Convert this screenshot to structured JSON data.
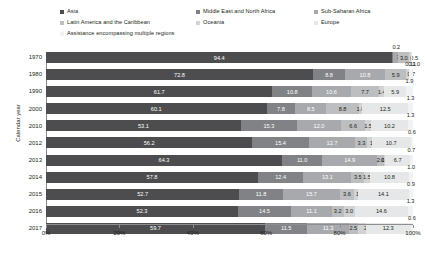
{
  "chart_data": {
    "type": "bar",
    "orientation": "horizontal",
    "stacked": true,
    "stacked_mode": "percent",
    "title": "",
    "xlabel": "",
    "ylabel": "Calendar year",
    "xlim": [
      0,
      100
    ],
    "xticks": [
      0,
      20,
      40,
      60,
      80,
      100
    ],
    "xticklabels": [
      "0%",
      "20%",
      "40%",
      "60%",
      "80%",
      "100%"
    ],
    "grid": false,
    "legend_position": "top",
    "categories": [
      "1970",
      "1980",
      "1990",
      "2000",
      "2010",
      "2012",
      "2013",
      "2014",
      "2015",
      "2016",
      "2017"
    ],
    "series": [
      {
        "name": "Asia",
        "color": "#4d4d4f",
        "values": [
          94.4,
          72.8,
          61.7,
          60.1,
          53.1,
          56.2,
          64.3,
          57.8,
          52.7,
          52.3,
          59.7
        ]
      },
      {
        "name": "Middle East and North Africa",
        "color": "#808285",
        "values": [
          0.2,
          8.8,
          10.8,
          7.8,
          15.3,
          15.4,
          11.0,
          12.4,
          11.8,
          14.5,
          11.5
        ]
      },
      {
        "name": "Sub-Saharan Africa",
        "color": "#a7a9ac",
        "values": [
          1.4,
          10.8,
          10.6,
          8.5,
          12.0,
          12.7,
          14.9,
          13.1,
          15.7,
          11.1,
          11.3
        ]
      },
      {
        "name": "Latin America and the Caribbean",
        "color": "#bcbec0",
        "values": [
          3.0,
          5.9,
          7.7,
          8.8,
          6.6,
          3.3,
          2.0,
          3.5,
          3.6,
          3.2,
          2.5
        ]
      },
      {
        "name": "Oceania",
        "color": "#d1d3d4",
        "values": [
          0.5,
          0.7,
          1.4,
          1.0,
          1.5,
          1.1,
          0.3,
          1.5,
          1.1,
          3.0,
          2.1
        ]
      },
      {
        "name": "Europe",
        "color": "#e6e7e8",
        "values": [
          0.1,
          0.1,
          5.9,
          12.5,
          10.2,
          10.7,
          6.7,
          10.8,
          14.1,
          14.6,
          12.3
        ]
      },
      {
        "name": "Assistance encompassing multiple regions",
        "color": "#f1f2f2",
        "values": [
          0.0,
          1.0,
          1.9,
          1.3,
          1.3,
          0.6,
          0.7,
          1.0,
          0.9,
          1.3,
          0.6
        ]
      }
    ],
    "rows": [
      {
        "year": "1970",
        "segments": [
          {
            "series": "Asia",
            "value": "94.4",
            "pos": "in"
          },
          {
            "series": "Middle East and North Africa",
            "value": "0.2",
            "pos": "out-right"
          },
          {
            "series": "Sub-Saharan Africa",
            "value": "1.4",
            "pos": "side"
          },
          {
            "series": "Latin America and the Caribbean",
            "value": "3.0",
            "pos": "in"
          },
          {
            "series": "Oceania",
            "value": "0.5",
            "pos": "side-below"
          },
          {
            "series": "Europe",
            "value": "0.1",
            "pos": "below"
          },
          {
            "series": "Assistance encompassing multiple regions",
            "value": "",
            "pos": "none"
          }
        ]
      },
      {
        "year": "1980",
        "segments": [
          {
            "series": "Asia",
            "value": "72.8",
            "pos": "in"
          },
          {
            "series": "Middle East and North Africa",
            "value": "8.8",
            "pos": "in"
          },
          {
            "series": "Sub-Saharan Africa",
            "value": "10.8",
            "pos": "in"
          },
          {
            "series": "Latin America and the Caribbean",
            "value": "5.9",
            "pos": "in"
          },
          {
            "series": "Oceania",
            "value": "0.7",
            "pos": "side"
          },
          {
            "series": "Europe",
            "value": "0.1",
            "pos": "above"
          },
          {
            "series": "Assistance encompassing multiple regions",
            "value": "1.0",
            "pos": "out-right"
          }
        ]
      },
      {
        "year": "1990",
        "segments": [
          {
            "series": "Asia",
            "value": "61.7",
            "pos": "in"
          },
          {
            "series": "Middle East and North Africa",
            "value": "10.8",
            "pos": "in"
          },
          {
            "series": "Sub-Saharan Africa",
            "value": "10.6",
            "pos": "in"
          },
          {
            "series": "Latin America and the Caribbean",
            "value": "7.7",
            "pos": "in"
          },
          {
            "series": "Oceania",
            "value": "1.4",
            "pos": "in"
          },
          {
            "series": "Europe",
            "value": "5.9",
            "pos": "in"
          },
          {
            "series": "Assistance encompassing multiple regions",
            "value": "1.9",
            "pos": "above"
          }
        ]
      },
      {
        "year": "2000",
        "segments": [
          {
            "series": "Asia",
            "value": "60.1",
            "pos": "in"
          },
          {
            "series": "Middle East and North Africa",
            "value": "7.8",
            "pos": "in"
          },
          {
            "series": "Sub-Saharan Africa",
            "value": "8.5",
            "pos": "in"
          },
          {
            "series": "Latin America and the Caribbean",
            "value": "8.8",
            "pos": "in"
          },
          {
            "series": "Oceania",
            "value": "1.0",
            "pos": "in"
          },
          {
            "series": "Europe",
            "value": "12.5",
            "pos": "in"
          },
          {
            "series": "Assistance encompassing multiple regions",
            "value": "1.3",
            "pos": "above"
          }
        ]
      },
      {
        "year": "2010",
        "segments": [
          {
            "series": "Asia",
            "value": "53.1",
            "pos": "in"
          },
          {
            "series": "Middle East and North Africa",
            "value": "15.3",
            "pos": "in"
          },
          {
            "series": "Sub-Saharan Africa",
            "value": "12.0",
            "pos": "in"
          },
          {
            "series": "Latin America and the Caribbean",
            "value": "6.6",
            "pos": "in"
          },
          {
            "series": "Oceania",
            "value": "1.5",
            "pos": "in"
          },
          {
            "series": "Europe",
            "value": "10.2",
            "pos": "in"
          },
          {
            "series": "Assistance encompassing multiple regions",
            "value": "1.3",
            "pos": "above"
          }
        ]
      },
      {
        "year": "2012",
        "segments": [
          {
            "series": "Asia",
            "value": "56.2",
            "pos": "in"
          },
          {
            "series": "Middle East and North Africa",
            "value": "15.4",
            "pos": "in"
          },
          {
            "series": "Sub-Saharan Africa",
            "value": "12.7",
            "pos": "in"
          },
          {
            "series": "Latin America and the Caribbean",
            "value": "3.3",
            "pos": "in"
          },
          {
            "series": "Oceania",
            "value": "1.1",
            "pos": "side"
          },
          {
            "series": "Europe",
            "value": "10.7",
            "pos": "in"
          },
          {
            "series": "Assistance encompassing multiple regions",
            "value": "0.6",
            "pos": "above"
          }
        ]
      },
      {
        "year": "2013",
        "segments": [
          {
            "series": "Asia",
            "value": "64.3",
            "pos": "in"
          },
          {
            "series": "Middle East and North Africa",
            "value": "11.0",
            "pos": "in"
          },
          {
            "series": "Sub-Saharan Africa",
            "value": "14.9",
            "pos": "in"
          },
          {
            "series": "Latin America and the Caribbean",
            "value": "2.0",
            "pos": "in"
          },
          {
            "series": "Oceania",
            "value": "0.3",
            "pos": "in"
          },
          {
            "series": "Europe",
            "value": "6.7",
            "pos": "in"
          },
          {
            "series": "Assistance encompassing multiple regions",
            "value": "0.7",
            "pos": "above"
          }
        ]
      },
      {
        "year": "2014",
        "segments": [
          {
            "series": "Asia",
            "value": "57.8",
            "pos": "in"
          },
          {
            "series": "Middle East and North Africa",
            "value": "12.4",
            "pos": "in"
          },
          {
            "series": "Sub-Saharan Africa",
            "value": "13.1",
            "pos": "in"
          },
          {
            "series": "Latin America and the Caribbean",
            "value": "3.5",
            "pos": "in"
          },
          {
            "series": "Oceania",
            "value": "1.5",
            "pos": "in"
          },
          {
            "series": "Europe",
            "value": "10.8",
            "pos": "in"
          },
          {
            "series": "Assistance encompassing multiple regions",
            "value": "1.0",
            "pos": "above"
          }
        ]
      },
      {
        "year": "2015",
        "segments": [
          {
            "series": "Asia",
            "value": "52.7",
            "pos": "in"
          },
          {
            "series": "Middle East and North Africa",
            "value": "11.8",
            "pos": "in"
          },
          {
            "series": "Sub-Saharan Africa",
            "value": "15.7",
            "pos": "in"
          },
          {
            "series": "Latin America and the Caribbean",
            "value": "3.6",
            "pos": "in"
          },
          {
            "series": "Oceania",
            "value": "1.1",
            "pos": "side"
          },
          {
            "series": "Europe",
            "value": "14.1",
            "pos": "in"
          },
          {
            "series": "Assistance encompassing multiple regions",
            "value": "0.9",
            "pos": "above"
          }
        ]
      },
      {
        "year": "2016",
        "segments": [
          {
            "series": "Asia",
            "value": "52.3",
            "pos": "in"
          },
          {
            "series": "Middle East and North Africa",
            "value": "14.5",
            "pos": "in"
          },
          {
            "series": "Sub-Saharan Africa",
            "value": "11.1",
            "pos": "in"
          },
          {
            "series": "Latin America and the Caribbean",
            "value": "3.2",
            "pos": "in"
          },
          {
            "series": "Oceania",
            "value": "3.0",
            "pos": "in"
          },
          {
            "series": "Europe",
            "value": "14.6",
            "pos": "in"
          },
          {
            "series": "Assistance encompassing multiple regions",
            "value": "1.3",
            "pos": "above"
          }
        ]
      },
      {
        "year": "2017",
        "segments": [
          {
            "series": "Asia",
            "value": "59.7",
            "pos": "in"
          },
          {
            "series": "Middle East and North Africa",
            "value": "11.5",
            "pos": "in"
          },
          {
            "series": "Sub-Saharan Africa",
            "value": "11.3",
            "pos": "in"
          },
          {
            "series": "Latin America and the Caribbean",
            "value": "2.5",
            "pos": "in"
          },
          {
            "series": "Oceania",
            "value": "2.1",
            "pos": "side"
          },
          {
            "series": "Europe",
            "value": "12.3",
            "pos": "in"
          },
          {
            "series": "Assistance encompassing multiple regions",
            "value": "0.6",
            "pos": "above"
          }
        ]
      }
    ]
  },
  "legend": {
    "rows": [
      [
        {
          "label": "Asia",
          "color": "#4d4d4f"
        },
        {
          "label": "Middle East and North Africa",
          "color": "#808285"
        },
        {
          "label": "Sub-Saharan Africa",
          "color": "#a7a9ac"
        }
      ],
      [
        {
          "label": "Latin America and the Caribbean",
          "color": "#bcbec0"
        },
        {
          "label": "Oceania",
          "color": "#d1d3d4"
        },
        {
          "label": "Europe",
          "color": "#e6e7e8"
        }
      ],
      [
        {
          "label": "Assistance encompassing multiple regions",
          "color": "#f1f2f2"
        }
      ]
    ]
  },
  "axis": {
    "ylabel": "Calendar year",
    "xticklabels": [
      "0%",
      "20%",
      "40%",
      "60%",
      "80%",
      "100%"
    ]
  }
}
